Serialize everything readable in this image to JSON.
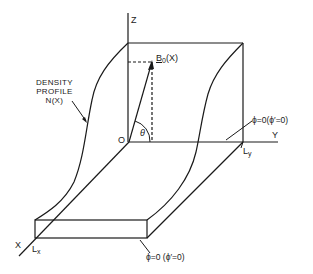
{
  "diagram": {
    "type": "3d-slab-geometry",
    "axes": {
      "z_label": "Z",
      "y_label": "Y",
      "x_label": "X",
      "origin_label": "O"
    },
    "vector": {
      "label": "B",
      "subscript": "0",
      "argument": "(X)",
      "angle_label": "θ"
    },
    "density_profile": {
      "line1": "DENSITY",
      "line2": "PROFILE",
      "line3": "N(X)"
    },
    "boundary_right": "ϕ=0(ϕ′=0)",
    "boundary_bottom": "ϕ=0 (ϕ′=0)",
    "length_x": {
      "main": "L",
      "sub": "x"
    },
    "length_y": {
      "main": "L",
      "sub": "y"
    },
    "stroke_color": "#1a1a1a",
    "background_color": "#ffffff"
  }
}
